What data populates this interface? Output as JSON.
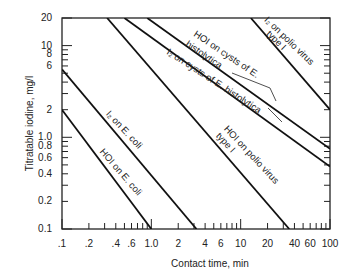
{
  "chart_data": {
    "type": "line",
    "title": "",
    "xlabel": "Contact time, min",
    "ylabel": "Titratable iodine, mg/l",
    "xscale": "log",
    "yscale": "log",
    "xlim": [
      0.1,
      100
    ],
    "ylim": [
      0.1,
      20
    ],
    "grid": false,
    "x_tick_labels": [
      ".1",
      ".2",
      ".4",
      ".6",
      "1.0",
      "2",
      "4",
      "6",
      "10",
      "20",
      "40",
      "60",
      "100"
    ],
    "x_tick_values": [
      0.1,
      0.2,
      0.4,
      0.6,
      1.0,
      2,
      4,
      6,
      10,
      20,
      40,
      60,
      100
    ],
    "y_tick_labels": [
      "20",
      "10",
      "8",
      "6",
      "2",
      "1.0",
      "0.8",
      "0.6",
      "0.4",
      "0.2",
      "0.1"
    ],
    "y_tick_values": [
      20,
      10,
      8,
      6,
      2,
      1.0,
      0.8,
      0.6,
      0.4,
      0.2,
      0.1
    ],
    "series": [
      {
        "name": "HOI on E. coli",
        "points": [
          [
            0.1,
            2.0
          ],
          [
            1.0,
            0.1
          ]
        ]
      },
      {
        "name": "I2 on E. coli",
        "points": [
          [
            0.1,
            5.5
          ],
          [
            3.2,
            0.1
          ]
        ]
      },
      {
        "name": "HOI on polio virus type I",
        "points": [
          [
            0.32,
            20
          ],
          [
            35,
            0.1
          ]
        ]
      },
      {
        "name": "I2 on cysts of E. histolytica",
        "points": [
          [
            0.5,
            20
          ],
          [
            100,
            0.48
          ]
        ]
      },
      {
        "name": "HOI on cysts of E. histolytica",
        "points": [
          [
            0.9,
            20
          ],
          [
            100,
            0.75
          ]
        ]
      },
      {
        "name": "I2 on polio virus type I",
        "points": [
          [
            13,
            20
          ],
          [
            100,
            2.0
          ]
        ]
      }
    ],
    "annotations": [
      "I₂ on polio virus type I",
      "HOI on cysts of E. histolytica",
      "I₂ on cysts of E. histolytica",
      "HOI on polio virus type I",
      "I₂ on E. coli",
      "HOI on E. coli"
    ]
  },
  "labels": {
    "x_title": "Contact time, min",
    "y_title": "Titratable iodine, mg/l",
    "ann_i2_polio_1": "I₂ on polio virus",
    "ann_i2_polio_2": "type I",
    "ann_hoi_ehist_1": "HOI on cysts of E.",
    "ann_hoi_ehist_2": "histolytica",
    "ann_i2_ehist": "I₂ on cysts of E. histolytica",
    "ann_hoi_polio_1": "HOI on polio virus",
    "ann_hoi_polio_2": "type I",
    "ann_i2_ecoli": "I₂ on E. coli",
    "ann_hoi_ecoli": "HOI on E. coli"
  }
}
